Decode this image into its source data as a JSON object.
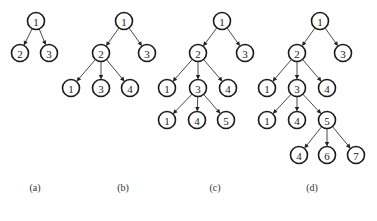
{
  "figure": {
    "trees": [
      {
        "id": "a",
        "caption": "(a)",
        "nodes": [
          {
            "id": "a-r",
            "label": "1"
          },
          {
            "id": "a-2",
            "label": "2",
            "parent": "a-r"
          },
          {
            "id": "a-3",
            "label": "3",
            "parent": "a-r"
          }
        ]
      },
      {
        "id": "b",
        "caption": "(b)",
        "nodes": [
          {
            "id": "b-r",
            "label": "1"
          },
          {
            "id": "b-2",
            "label": "2",
            "parent": "b-r"
          },
          {
            "id": "b-3",
            "label": "3",
            "parent": "b-r"
          },
          {
            "id": "b-21",
            "label": "1",
            "parent": "b-2"
          },
          {
            "id": "b-23",
            "label": "3",
            "parent": "b-2"
          },
          {
            "id": "b-24",
            "label": "4",
            "parent": "b-2"
          }
        ]
      },
      {
        "id": "c",
        "caption": "(c)",
        "nodes": [
          {
            "id": "c-r",
            "label": "1"
          },
          {
            "id": "c-2",
            "label": "2",
            "parent": "c-r"
          },
          {
            "id": "c-3",
            "label": "3",
            "parent": "c-r"
          },
          {
            "id": "c-21",
            "label": "1",
            "parent": "c-2"
          },
          {
            "id": "c-23",
            "label": "3",
            "parent": "c-2"
          },
          {
            "id": "c-24",
            "label": "4",
            "parent": "c-2"
          },
          {
            "id": "c-231",
            "label": "1",
            "parent": "c-23"
          },
          {
            "id": "c-234",
            "label": "4",
            "parent": "c-23"
          },
          {
            "id": "c-235",
            "label": "5",
            "parent": "c-23"
          }
        ]
      },
      {
        "id": "d",
        "caption": "(d)",
        "nodes": [
          {
            "id": "d-r",
            "label": "1"
          },
          {
            "id": "d-2",
            "label": "2",
            "parent": "d-r"
          },
          {
            "id": "d-3",
            "label": "3",
            "parent": "d-r"
          },
          {
            "id": "d-21",
            "label": "1",
            "parent": "d-2"
          },
          {
            "id": "d-23",
            "label": "3",
            "parent": "d-2"
          },
          {
            "id": "d-24",
            "label": "4",
            "parent": "d-2"
          },
          {
            "id": "d-231",
            "label": "1",
            "parent": "d-23"
          },
          {
            "id": "d-234",
            "label": "4",
            "parent": "d-23"
          },
          {
            "id": "d-235",
            "label": "5",
            "parent": "d-23"
          },
          {
            "id": "d-2354",
            "label": "4",
            "parent": "d-235"
          },
          {
            "id": "d-2356",
            "label": "6",
            "parent": "d-235"
          },
          {
            "id": "d-2357",
            "label": "7",
            "parent": "d-235"
          }
        ]
      }
    ]
  }
}
